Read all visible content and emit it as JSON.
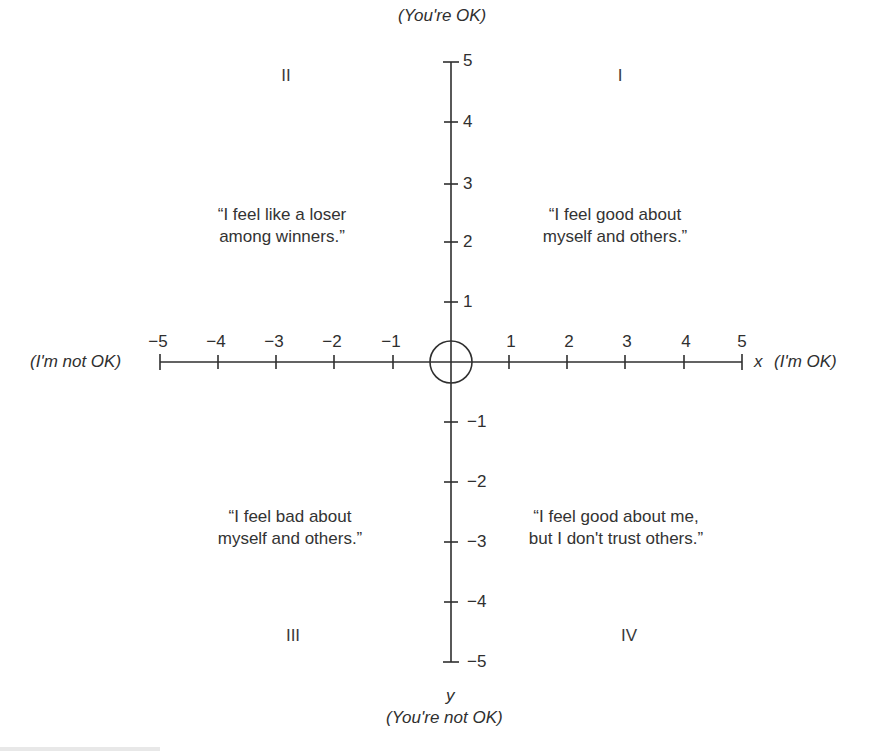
{
  "diagram": {
    "type": "quadrant-diagram",
    "axes": {
      "x": {
        "name": "x",
        "positive_label": "(I'm OK)",
        "negative_label": "(I'm not OK)",
        "ticks": [
          "−5",
          "−4",
          "−3",
          "−2",
          "−1",
          "1",
          "2",
          "3",
          "4",
          "5"
        ],
        "range": [
          -5,
          5
        ]
      },
      "y": {
        "name": "y",
        "positive_label": "(You're OK)",
        "negative_label": "(You're not OK)",
        "ticks_positive": [
          "1",
          "2",
          "3",
          "4",
          "5"
        ],
        "ticks_negative": [
          "−1",
          "−2",
          "−3",
          "−4",
          "−5"
        ],
        "range": [
          -5,
          5
        ]
      }
    },
    "origin_marker": "circle",
    "quadrants": [
      {
        "numeral": "I",
        "quote_line1": "“I feel good about",
        "quote_line2": "myself and others.”"
      },
      {
        "numeral": "II",
        "quote_line1": "“I feel like a loser",
        "quote_line2": "among winners.”"
      },
      {
        "numeral": "III",
        "quote_line1": "“I feel bad about",
        "quote_line2": "myself and others.”"
      },
      {
        "numeral": "IV",
        "quote_line1": "“I feel good about me,",
        "quote_line2": "but I don't trust others.”"
      }
    ],
    "colors": {
      "background": "#ffffff",
      "ink": "#2f2f2f"
    }
  }
}
